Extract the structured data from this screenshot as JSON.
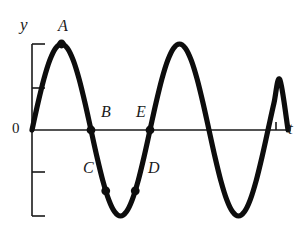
{
  "figure": {
    "background_color": "#ffffff",
    "curve_color": "#0d0d0d",
    "axis_color": "#1a1a1a",
    "point_color": "#0d0d0d"
  },
  "axes": {
    "y_axis": {
      "label": "y",
      "origin_label": "0",
      "tick_labels": [
        "",
        "",
        "",
        ""
      ],
      "tick_count": 4
    },
    "x_axis": {
      "label": "t",
      "tick_labels": [],
      "tick_count": 1
    }
  },
  "points": [
    {
      "id": "A",
      "label": "A",
      "t": 0.25,
      "y": 1.0,
      "description": "first crest"
    },
    {
      "id": "B",
      "label": "B",
      "t": 0.5,
      "y": 0.0,
      "description": "descending zero crossing"
    },
    {
      "id": "C",
      "label": "C",
      "t": 0.625,
      "y": -0.707,
      "description": "descending, negative"
    },
    {
      "id": "D",
      "label": "D",
      "t": 0.875,
      "y": -0.707,
      "description": "ascending, negative"
    },
    {
      "id": "E",
      "label": "E",
      "t": 1.0,
      "y": 0.0,
      "description": "ascending zero crossing"
    }
  ],
  "chart_data": {
    "type": "line",
    "title": "",
    "xlabel": "t",
    "ylabel": "y",
    "xlim": [
      0,
      2.17
    ],
    "ylim": [
      -1.15,
      1.15
    ],
    "grid": false,
    "legend": "none",
    "function": "y = sin(2*pi*t)",
    "periods_shown": 2.17,
    "amplitude": 1,
    "series": [
      {
        "name": "y",
        "x": [
          0,
          0.05,
          0.1,
          0.15,
          0.2,
          0.25,
          0.3,
          0.35,
          0.4,
          0.45,
          0.5,
          0.55,
          0.6,
          0.65,
          0.7,
          0.75,
          0.8,
          0.85,
          0.9,
          0.95,
          1.0,
          1.05,
          1.1,
          1.15,
          1.2,
          1.25,
          1.3,
          1.35,
          1.4,
          1.45,
          1.5,
          1.55,
          1.6,
          1.65,
          1.7,
          1.75,
          1.8,
          1.85,
          1.9,
          1.95,
          2.0,
          2.05,
          2.1,
          2.17
        ],
        "values": [
          0,
          0.309,
          0.588,
          0.809,
          0.951,
          1.0,
          0.951,
          0.809,
          0.588,
          0.309,
          0,
          -0.309,
          -0.588,
          -0.809,
          -0.951,
          -1.0,
          -0.951,
          -0.809,
          -0.588,
          -0.309,
          0,
          0.309,
          0.588,
          0.809,
          0.951,
          1.0,
          0.951,
          0.809,
          0.588,
          0.309,
          0,
          -0.309,
          -0.588,
          -0.809,
          -0.951,
          -1.0,
          -0.951,
          -0.809,
          -0.588,
          -0.309,
          0,
          0.309,
          0.588,
          0.0
        ]
      }
    ],
    "annotations": [
      {
        "text": "A",
        "x": 0.25,
        "y": 1.0
      },
      {
        "text": "B",
        "x": 0.5,
        "y": 0.0
      },
      {
        "text": "C",
        "x": 0.625,
        "y": -0.707
      },
      {
        "text": "D",
        "x": 0.875,
        "y": -0.707
      },
      {
        "text": "E",
        "x": 1.0,
        "y": 0.0
      }
    ]
  }
}
